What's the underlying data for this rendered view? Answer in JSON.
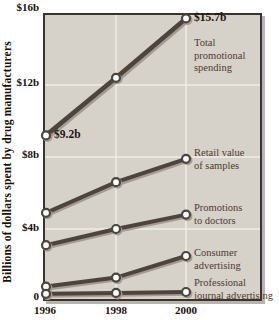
{
  "figure": {
    "y_axis_title": "Billions of dollars spent by drug manufacturers"
  },
  "chart_data": {
    "type": "line",
    "title": "",
    "ylabel": "Billions of dollars spent by drug manufacturers",
    "xlabel": "",
    "x": [
      1996,
      1998,
      2000
    ],
    "x_tick_labels": [
      "1996",
      "1998",
      "2000"
    ],
    "y_tick_labels": [
      "$16b",
      "$12b",
      "$8b",
      "$4b",
      "0"
    ],
    "y_tick_values": [
      16,
      12,
      8,
      4,
      0
    ],
    "ylim": [
      0,
      16
    ],
    "grid": true,
    "legend_position": "inline-right-inside-plot",
    "series": [
      {
        "name": "Total promotional spending",
        "label_lines": [
          "Total",
          "promotional",
          "spending"
        ],
        "values": [
          9.2,
          12.4,
          15.7
        ]
      },
      {
        "name": "Retail value of samples",
        "label_lines": [
          "Retail value",
          "of samples"
        ],
        "values": [
          4.9,
          6.6,
          7.9
        ]
      },
      {
        "name": "Promotions to doctors",
        "label_lines": [
          "Promotions",
          "to doctors"
        ],
        "values": [
          3.1,
          4.0,
          4.8
        ]
      },
      {
        "name": "Consumer advertising",
        "label_lines": [
          "Consumer",
          "advertising"
        ],
        "values": [
          0.8,
          1.3,
          2.5
        ]
      },
      {
        "name": "Professional journal advertising",
        "label_lines": [
          "Professional",
          "journal advertising"
        ],
        "values": [
          0.4,
          0.45,
          0.5
        ]
      }
    ],
    "annotations": [
      {
        "text": "$9.2b",
        "series": 0,
        "point": 0,
        "side": "right"
      },
      {
        "text": "$15.7b",
        "series": 0,
        "point": 2,
        "side": "right"
      }
    ],
    "colors": {
      "plot_bg": "#d6d2ca",
      "grid": "#efece4",
      "frame": "#39342f",
      "line": "#4b443f",
      "line_shadow": "#a69b90",
      "marker_fill": "#ffffff",
      "tick_text": "#17120e",
      "series_label_text": "#4d3a2f",
      "annotation_text": "#1d1510"
    }
  }
}
